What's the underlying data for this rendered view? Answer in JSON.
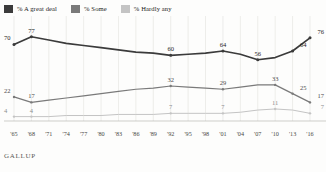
{
  "legend": {
    "items": [
      {
        "label": "% A great deal",
        "color": "#3b3b3b",
        "name": "legend-a-great-deal"
      },
      {
        "label": "% Some",
        "color": "#7a7a7a",
        "name": "legend-some"
      },
      {
        "label": "% Hardly any",
        "color": "#c4c4c4",
        "name": "legend-hardly-any"
      }
    ]
  },
  "footer": {
    "source": "GALLUP"
  },
  "chart_data": {
    "type": "line",
    "title": "",
    "subtitle": "",
    "xlabel": "",
    "ylabel": "",
    "ylim": [
      0,
      85
    ],
    "grid": "vertical",
    "legend_position": "top-left",
    "categories": [
      "'65",
      "'68",
      "'71",
      "'74",
      "'77",
      "'80",
      "'83",
      "'86",
      "'89",
      "'92",
      "'95",
      "'98",
      "'01",
      "'04",
      "'07",
      "'10",
      "'13",
      "'16"
    ],
    "series": [
      {
        "name": "% A great deal",
        "color": "#3b3b3b",
        "values": [
          70,
          77,
          74,
          71,
          69,
          67,
          65,
          63,
          62,
          60,
          61,
          62,
          64,
          61,
          56,
          58,
          64,
          76
        ],
        "labeled_points": [
          {
            "category": "'65",
            "value": 70,
            "text": "70",
            "anchor": "left"
          },
          {
            "category": "'68",
            "value": 77,
            "text": "77",
            "anchor": "center"
          },
          {
            "category": "'92",
            "value": 60,
            "text": "60",
            "anchor": "center"
          },
          {
            "category": "'01",
            "value": 64,
            "text": "64",
            "anchor": "center"
          },
          {
            "category": "'07",
            "value": 56,
            "text": "56",
            "anchor": "center"
          },
          {
            "category": "'13",
            "value": 64,
            "text": "64",
            "anchor": "right"
          },
          {
            "category": "'16",
            "value": 76,
            "text": "76",
            "anchor": "right"
          }
        ]
      },
      {
        "name": "% Some",
        "color": "#7a7a7a",
        "values": [
          22,
          17,
          19,
          21,
          23,
          25,
          27,
          29,
          30,
          32,
          31,
          30,
          29,
          31,
          33,
          33,
          25,
          17
        ],
        "labeled_points": [
          {
            "category": "'65",
            "value": 22,
            "text": "22",
            "anchor": "left"
          },
          {
            "category": "'68",
            "value": 17,
            "text": "17",
            "anchor": "center"
          },
          {
            "category": "'92",
            "value": 32,
            "text": "32",
            "anchor": "center"
          },
          {
            "category": "'01",
            "value": 29,
            "text": "29",
            "anchor": "center"
          },
          {
            "category": "'10",
            "value": 33,
            "text": "33",
            "anchor": "center"
          },
          {
            "category": "'13",
            "value": 25,
            "text": "25",
            "anchor": "right"
          },
          {
            "category": "'16",
            "value": 17,
            "text": "17",
            "anchor": "right"
          }
        ]
      },
      {
        "name": "% Hardly any",
        "color": "#c4c4c4",
        "values": [
          4,
          4,
          4,
          5,
          5,
          5,
          6,
          6,
          6,
          7,
          7,
          7,
          7,
          8,
          10,
          11,
          10,
          7
        ],
        "labeled_points": [
          {
            "category": "'65",
            "value": 4,
            "text": "4",
            "anchor": "left"
          },
          {
            "category": "'68",
            "value": 4,
            "text": "4",
            "anchor": "center"
          },
          {
            "category": "'92",
            "value": 7,
            "text": "7",
            "anchor": "center"
          },
          {
            "category": "'01",
            "value": 7,
            "text": "7",
            "anchor": "center"
          },
          {
            "category": "'10",
            "value": 11,
            "text": "11",
            "anchor": "center"
          },
          {
            "category": "'16",
            "value": 7,
            "text": "7",
            "anchor": "right"
          }
        ]
      }
    ]
  }
}
